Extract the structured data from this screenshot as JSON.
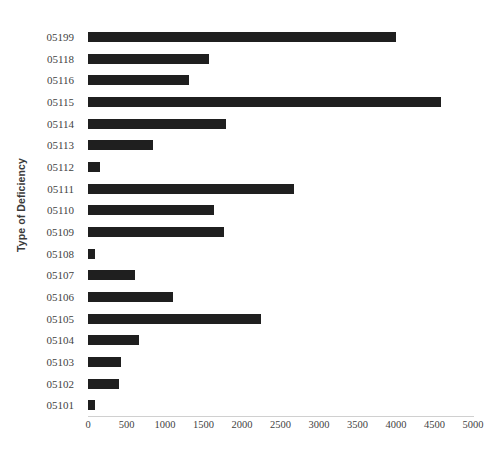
{
  "chart_data": {
    "type": "bar",
    "orientation": "horizontal",
    "title": "",
    "xlabel": "",
    "ylabel": "Type of Deficiency",
    "xlim": [
      0,
      5000
    ],
    "xticks": [
      0,
      500,
      1000,
      1500,
      2000,
      2500,
      3000,
      3500,
      4000,
      4500,
      5000
    ],
    "xtick_labels": [
      "0",
      "500",
      "1000",
      "1500",
      "2000",
      "2500",
      "3000",
      "3500",
      "4000",
      "4500",
      "5000"
    ],
    "grid": false,
    "legend": null,
    "bar_color": "#1f1f1f",
    "categories": [
      "05199",
      "05118",
      "05116",
      "05115",
      "05114",
      "05113",
      "05112",
      "05111",
      "05110",
      "05109",
      "05108",
      "05107",
      "05106",
      "05105",
      "05104",
      "05103",
      "05102",
      "05101"
    ],
    "values": [
      4000,
      1570,
      1310,
      4580,
      1790,
      845,
      155,
      2670,
      1635,
      1765,
      90,
      610,
      1105,
      2245,
      660,
      430,
      400,
      90
    ]
  }
}
